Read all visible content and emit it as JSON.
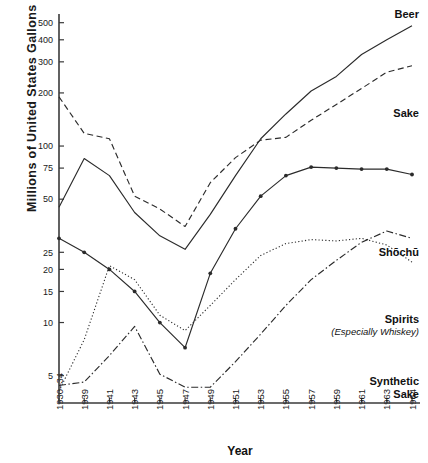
{
  "chart_data": {
    "type": "line",
    "title": "",
    "xlabel": "Year",
    "ylabel": "Millions of United States Gallons",
    "yscale": "log",
    "ylim": [
      3.5,
      560
    ],
    "grid": false,
    "legend_position": "inline-right-of-series",
    "x_tick_labels": [
      "1930–34",
      "1939",
      "1941",
      "1943",
      "1945",
      "1947",
      "1949",
      "1951",
      "1953",
      "1955",
      "1957",
      "1959",
      "1961",
      "1963",
      "1964"
    ],
    "y_tick_labels": [
      "500",
      "400",
      "300",
      "200",
      "100",
      "75",
      "50",
      "25",
      "20",
      "15",
      "10",
      "5"
    ],
    "y_tick_values": [
      500,
      400,
      300,
      200,
      100,
      75,
      50,
      25,
      20,
      15,
      10,
      5
    ],
    "categories": [
      "1930-34",
      "1939",
      "1941",
      "1943",
      "1945",
      "1947",
      "1949",
      "1951",
      "1953",
      "1955",
      "1957",
      "1959",
      "1961",
      "1963",
      "1964"
    ],
    "series": [
      {
        "name": "Beer",
        "label": "Beer",
        "style": "solid",
        "marker": "none",
        "color": "#2b2b2b",
        "values": [
          45,
          85,
          68,
          42,
          31,
          26,
          41,
          68,
          110,
          152,
          205,
          248,
          330,
          400,
          480
        ]
      },
      {
        "name": "Sake",
        "label": "Sake",
        "style": "dashed",
        "marker": "none",
        "color": "#2b2b2b",
        "values": [
          190,
          118,
          110,
          52,
          44,
          35,
          62,
          86,
          108,
          112,
          140,
          172,
          212,
          262,
          285
        ]
      },
      {
        "name": "Shōchū",
        "label": "Shōchū",
        "style": "solid",
        "marker": "dot",
        "color": "#2b2b2b",
        "values": [
          30,
          25,
          20,
          15,
          10,
          7.2,
          19,
          34,
          52,
          68,
          76,
          75,
          74,
          74,
          69
        ]
      },
      {
        "name": "Spirits (Especially Whiskey)",
        "label": "Spirits",
        "sublabel": "(Especially Whiskey)",
        "style": "dashdot",
        "marker": "none",
        "color": "#2b2b2b",
        "values": [
          4.4,
          4.6,
          6.5,
          9.5,
          5.1,
          4.3,
          4.3,
          6.0,
          8.6,
          12.5,
          17.5,
          22.5,
          28.5,
          33,
          30
        ]
      },
      {
        "name": "Synthetic Sake",
        "label": "Synthetic",
        "sublabel": "Sake",
        "style": "dotted",
        "marker": "none",
        "color": "#2b2b2b",
        "values": [
          4.1,
          8.0,
          21,
          17.5,
          11,
          9.0,
          12.5,
          17.5,
          24,
          28,
          29.5,
          29,
          30,
          27.5,
          22
        ]
      }
    ],
    "annotations": [
      {
        "text": "Beer",
        "series": "Beer"
      },
      {
        "text": "Sake",
        "series": "Sake"
      },
      {
        "text": "Shōchū",
        "series": "Shōchū"
      },
      {
        "text": "Spirits",
        "series": "Spirits (Especially Whiskey)"
      },
      {
        "text": "(Especially Whiskey)",
        "series": "Spirits (Especially Whiskey)"
      },
      {
        "text": "Synthetic",
        "series": "Synthetic Sake"
      },
      {
        "text": "Sake",
        "series": "Synthetic Sake"
      }
    ]
  },
  "axis": {
    "y_title": "Millions of United States Gallons",
    "x_title": "Year"
  }
}
